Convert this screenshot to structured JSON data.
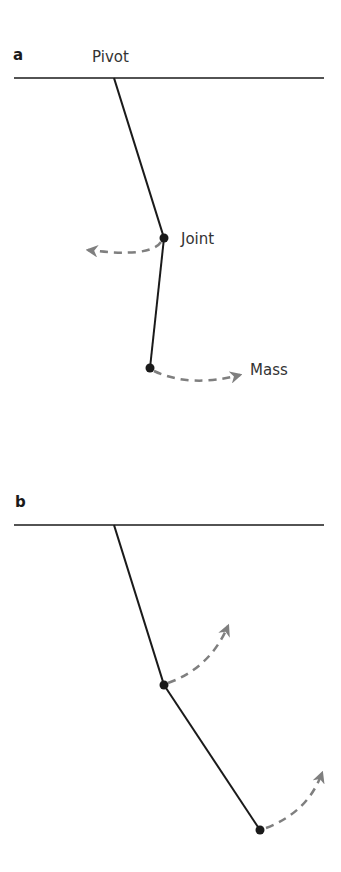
{
  "panels": [
    {
      "label": "a",
      "annotations": {
        "pivot": "Pivot",
        "joint": "Joint",
        "mass": "Mass"
      },
      "description": "Double pendulum, joint swings left while mass swings right (antiphase)"
    },
    {
      "label": "b",
      "description": "Double pendulum, joint and mass both swing up-right (in phase)"
    }
  ],
  "colors": {
    "rod": "#1a1a1a",
    "arrow": "#7f7f7f",
    "text": "#333333"
  }
}
